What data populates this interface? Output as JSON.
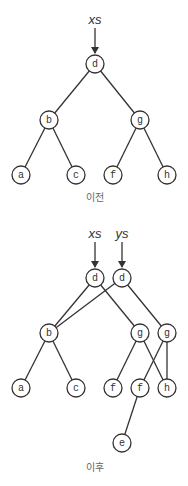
{
  "diagrams": [
    {
      "caption": "이전",
      "caption_pos": [
        95,
        201
      ],
      "pointers": [
        {
          "label": "xs",
          "x": 95,
          "label_y": 24,
          "arrow_from": 28,
          "arrow_to": 53
        }
      ],
      "nodes": [
        {
          "id": "d",
          "label": "d",
          "x": 95,
          "y": 64
        },
        {
          "id": "b",
          "label": "b",
          "x": 49,
          "y": 120
        },
        {
          "id": "g",
          "label": "g",
          "x": 140,
          "y": 120
        },
        {
          "id": "a",
          "label": "a",
          "x": 21,
          "y": 175
        },
        {
          "id": "c",
          "label": "c",
          "x": 76,
          "y": 175
        },
        {
          "id": "f",
          "label": "f",
          "x": 113,
          "y": 175
        },
        {
          "id": "h",
          "label": "h",
          "x": 167,
          "y": 175
        }
      ],
      "edges": [
        [
          "d",
          "b"
        ],
        [
          "d",
          "g"
        ],
        [
          "b",
          "a"
        ],
        [
          "b",
          "c"
        ],
        [
          "g",
          "f"
        ],
        [
          "g",
          "h"
        ]
      ]
    },
    {
      "caption": "이후",
      "caption_pos": [
        95,
        471
      ],
      "pointers": [
        {
          "label": "xs",
          "x": 95,
          "label_y": 238,
          "arrow_from": 242,
          "arrow_to": 267
        },
        {
          "label": "ys",
          "x": 122,
          "label_y": 238,
          "arrow_from": 242,
          "arrow_to": 267
        }
      ],
      "nodes": [
        {
          "id": "d1",
          "label": "d",
          "x": 95,
          "y": 278
        },
        {
          "id": "d2",
          "label": "d",
          "x": 122,
          "y": 278
        },
        {
          "id": "b",
          "label": "b",
          "x": 49,
          "y": 333
        },
        {
          "id": "g1",
          "label": "g",
          "x": 140,
          "y": 333
        },
        {
          "id": "g2",
          "label": "g",
          "x": 167,
          "y": 333
        },
        {
          "id": "a",
          "label": "a",
          "x": 21,
          "y": 388
        },
        {
          "id": "c",
          "label": "c",
          "x": 76,
          "y": 388
        },
        {
          "id": "f1",
          "label": "f",
          "x": 113,
          "y": 388
        },
        {
          "id": "f2",
          "label": "f",
          "x": 140,
          "y": 388
        },
        {
          "id": "h",
          "label": "h",
          "x": 167,
          "y": 388
        },
        {
          "id": "e",
          "label": "e",
          "x": 122,
          "y": 443
        }
      ],
      "edges": [
        [
          "d1",
          "b"
        ],
        [
          "d1",
          "g1"
        ],
        [
          "d2",
          "b"
        ],
        [
          "d2",
          "g2"
        ],
        [
          "b",
          "a"
        ],
        [
          "b",
          "c"
        ],
        [
          "g1",
          "f1"
        ],
        [
          "g1",
          "h"
        ],
        [
          "g2",
          "f2"
        ],
        [
          "g2",
          "h"
        ],
        [
          "f2",
          "e"
        ]
      ]
    }
  ],
  "node_radius": 9
}
